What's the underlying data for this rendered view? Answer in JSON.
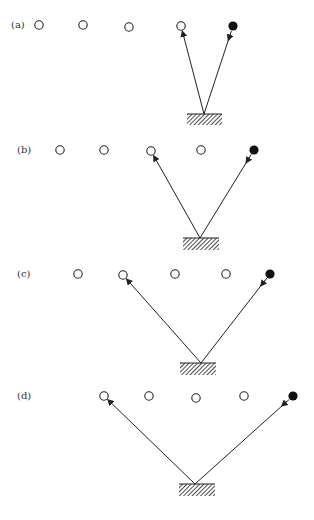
{
  "figure": {
    "colors": {
      "stroke": "#222222",
      "background": "#ffffff",
      "filled": "#111111"
    },
    "panels": [
      {
        "label": "(a)",
        "label_pos": [
          11,
          28
        ],
        "circles": [
          [
            39,
            25
          ],
          [
            83,
            25
          ],
          [
            129,
            27
          ],
          [
            181,
            26
          ]
        ],
        "filled": [
          233,
          26
        ],
        "apex": [
          204,
          114
        ],
        "mirror": {
          "x": 187,
          "y": 114,
          "w": 35,
          "h": 11
        },
        "out_target": [
          181,
          26
        ]
      },
      {
        "label": "(b)",
        "label_pos": [
          17,
          153
        ],
        "circles": [
          [
            60,
            150
          ],
          [
            104,
            150
          ],
          [
            151,
            151
          ],
          [
            201,
            150
          ]
        ],
        "filled": [
          254,
          150
        ],
        "apex": [
          200,
          238
        ],
        "mirror": {
          "x": 183,
          "y": 238,
          "w": 36,
          "h": 12
        },
        "out_target": [
          151,
          151
        ]
      },
      {
        "label": "(c)",
        "label_pos": [
          17,
          277
        ],
        "circles": [
          [
            78,
            274
          ],
          [
            123,
            275
          ],
          [
            175,
            274
          ],
          [
            226,
            274
          ]
        ],
        "filled": [
          270,
          274
        ],
        "apex": [
          201,
          363
        ],
        "mirror": {
          "x": 180,
          "y": 363,
          "w": 36,
          "h": 12
        },
        "out_target": [
          123,
          275
        ]
      },
      {
        "label": "(d)",
        "label_pos": [
          17,
          399
        ],
        "circles": [
          [
            104,
            396
          ],
          [
            149,
            396
          ],
          [
            196,
            398
          ],
          [
            244,
            396
          ]
        ],
        "filled": [
          293,
          396
        ],
        "apex": [
          195,
          484
        ],
        "mirror": {
          "x": 179,
          "y": 484,
          "w": 36,
          "h": 12
        },
        "out_target": [
          104,
          396
        ]
      }
    ]
  }
}
